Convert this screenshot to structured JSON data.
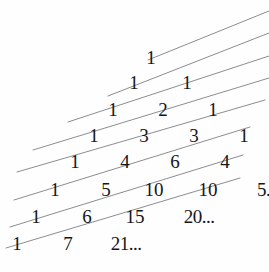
{
  "figure": {
    "width": 269,
    "height": 272,
    "background_color": "#fefefe",
    "text_color": "#15161a",
    "line_color": "#8b8d92"
  },
  "triangle": {
    "description": "Left-staircase Pascal's triangle, rows 0 through 7, lower rows truncated with ellipses",
    "row_count": 8,
    "rows": [
      {
        "index": 0,
        "left": 142,
        "top": 48,
        "cells": [
          {
            "text": "1",
            "width": 18
          }
        ]
      },
      {
        "index": 1,
        "left": 125,
        "top": 73,
        "cells": [
          {
            "text": "1",
            "width": 18
          },
          {
            "text": "1",
            "width": 18,
            "gap": 35
          }
        ]
      },
      {
        "index": 2,
        "left": 104,
        "top": 100,
        "cells": [
          {
            "text": "1",
            "width": 18
          },
          {
            "text": "2",
            "width": 18,
            "gap": 32
          },
          {
            "text": "1",
            "width": 18,
            "gap": 32
          }
        ]
      },
      {
        "index": 3,
        "left": 85,
        "top": 126,
        "cells": [
          {
            "text": "1",
            "width": 18
          },
          {
            "text": "3",
            "width": 18,
            "gap": 32
          },
          {
            "text": "3",
            "width": 18,
            "gap": 32
          },
          {
            "text": "1",
            "width": 18,
            "gap": 32
          }
        ]
      },
      {
        "index": 4,
        "left": 66,
        "top": 152,
        "cells": [
          {
            "text": "1",
            "width": 18
          },
          {
            "text": "4",
            "width": 18,
            "gap": 32
          },
          {
            "text": "6",
            "width": 18,
            "gap": 32
          },
          {
            "text": "4",
            "width": 18,
            "gap": 32
          },
          {
            "text": "1",
            "width": 18,
            "gap": 32
          }
        ]
      },
      {
        "index": 5,
        "left": 46,
        "top": 180,
        "cells": [
          {
            "text": "1",
            "width": 18
          },
          {
            "text": "5",
            "width": 18,
            "gap": 33
          },
          {
            "text": "10",
            "width": 26,
            "gap": 26
          },
          {
            "text": "10",
            "width": 26,
            "gap": 28
          },
          {
            "text": "5.. .",
            "width": 42,
            "gap": 28
          }
        ]
      },
      {
        "index": 6,
        "left": 27,
        "top": 207,
        "cells": [
          {
            "text": "1",
            "width": 18
          },
          {
            "text": "6",
            "width": 18,
            "gap": 33
          },
          {
            "text": "15",
            "width": 26,
            "gap": 26
          },
          {
            "text": "20...",
            "width": 46,
            "gap": 28
          }
        ]
      },
      {
        "index": 7,
        "left": 8,
        "top": 234,
        "cells": [
          {
            "text": "1",
            "width": 18
          },
          {
            "text": "7",
            "width": 18,
            "gap": 33
          },
          {
            "text": "21...",
            "width": 46,
            "gap": 26
          }
        ]
      }
    ]
  },
  "diagonals": {
    "description": "Seven parallel shallow diagonal lines running lower-left to upper-right across the triangle",
    "count": 7,
    "color": "#8b8d92",
    "stroke_width": 1,
    "segments": [
      {
        "index": 0,
        "x1": 148,
        "y1": 60,
        "x2": 269,
        "y2": 11
      },
      {
        "index": 1,
        "x1": 108,
        "y1": 96,
        "x2": 269,
        "y2": 33
      },
      {
        "index": 2,
        "x1": 68,
        "y1": 122,
        "x2": 269,
        "y2": 56
      },
      {
        "index": 3,
        "x1": 33,
        "y1": 150,
        "x2": 269,
        "y2": 78
      },
      {
        "index": 4,
        "x1": 17,
        "y1": 172,
        "x2": 265,
        "y2": 100
      },
      {
        "index": 5,
        "x1": 14,
        "y1": 200,
        "x2": 250,
        "y2": 127
      },
      {
        "index": 6,
        "x1": 10,
        "y1": 227,
        "x2": 243,
        "y2": 155
      },
      {
        "index": 7,
        "x1": 6,
        "y1": 248,
        "x2": 240,
        "y2": 178
      }
    ]
  }
}
